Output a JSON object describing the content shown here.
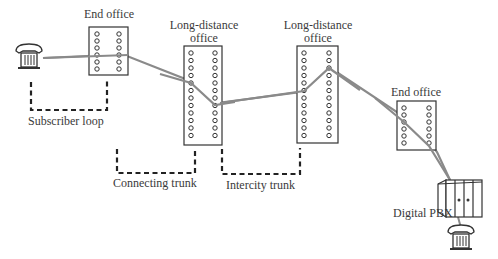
{
  "diagram": {
    "offices": [
      {
        "id": "end-office-1",
        "label_line1": "End office",
        "label_line2": ""
      },
      {
        "id": "long-distance-office-1",
        "label_line1": "Long-distance",
        "label_line2": "office"
      },
      {
        "id": "long-distance-office-2",
        "label_line1": "Long-distance",
        "label_line2": "office"
      },
      {
        "id": "end-office-2",
        "label_line1": "End office",
        "label_line2": ""
      }
    ],
    "segments": {
      "subscriber_loop": "Subscriber loop",
      "connecting_trunk": "Connecting trunk",
      "intercity_trunk": "Intercity trunk"
    },
    "pbx": {
      "label": "Digital PBX"
    },
    "icons": [
      "telephone-icon",
      "switch-office-icon",
      "pbx-cabinet-icon"
    ],
    "colors": {
      "line": "#8a8a8a",
      "stroke": "#333333",
      "dashed": "#222222"
    }
  }
}
